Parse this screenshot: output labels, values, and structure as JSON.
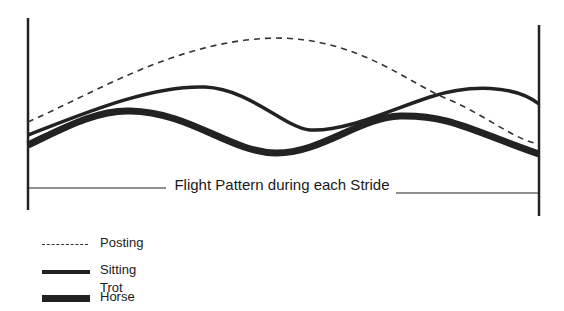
{
  "diagram": {
    "axis_label": "Flight Pattern during each Stride",
    "series": [
      {
        "name": "Posting",
        "style": "dashed",
        "color": "#333333"
      },
      {
        "name": "Sitting Trot",
        "style": "solid-medium",
        "color": "#222222"
      },
      {
        "name": "Horse",
        "style": "solid-thick",
        "color": "#222222"
      }
    ]
  },
  "legend": {
    "items": [
      {
        "label": "Posting"
      },
      {
        "label": "Sitting Trot"
      },
      {
        "label": "Horse"
      }
    ]
  }
}
